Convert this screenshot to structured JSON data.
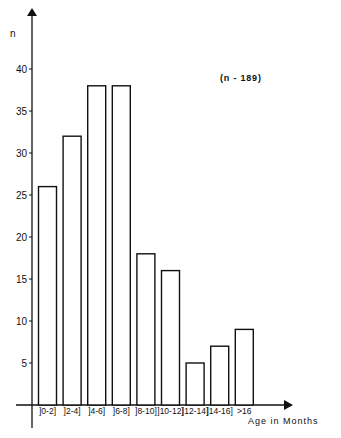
{
  "chart_data": {
    "type": "bar",
    "title": "",
    "xlabel": "Age in Months",
    "ylabel": "n",
    "annotation": "(n - 189)",
    "categories": [
      "]0-2]",
      "]2-4]",
      "]4-6]",
      "]6-8]",
      "]8-10]",
      "]10-12]",
      "]12-14]",
      "]14-16]",
      ">16"
    ],
    "values": [
      26,
      32,
      38,
      38,
      18,
      16,
      5,
      7,
      9
    ],
    "yticks": [
      5,
      10,
      15,
      20,
      25,
      30,
      35,
      40
    ],
    "ylim": [
      0,
      45
    ],
    "grid": false,
    "legend": null,
    "bar_fill": "#ffffff",
    "bar_stroke": "#111111"
  }
}
